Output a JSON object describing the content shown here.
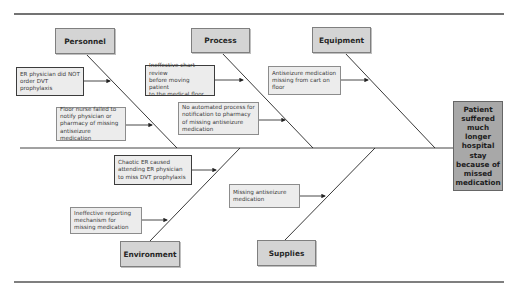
{
  "diagram": {
    "type": "fishbone",
    "effect": "Patient\nsuffered\nmuch\nlonger\nhospital\nstay\nbecause of\nmissed\nmedication",
    "categories": {
      "personnel": "Personnel",
      "process": "Process",
      "equipment": "Equipment",
      "environment": "Environment",
      "supplies": "Supplies"
    },
    "causes": {
      "personnel": [
        "ER physician did NOT\norder DVT prophylaxis",
        "Floor nurse failed to\nnotify physician or\npharmacy of missing\nantiseizure medication"
      ],
      "process": [
        "Ineffective chart review\nbefore moving patient\nto the medical floor",
        "No automated process for\nnotification to pharmacy\nof missing antiseizure\nmedication"
      ],
      "equipment": [
        "Antiseizure medication\nmissing from cart on\nfloor"
      ],
      "environment": [
        "Chaotic ER caused\nattending ER physician\nto miss DVT prophylaxis",
        "Ineffective reporting\nmechanism for\nmissing medication"
      ],
      "supplies": [
        "Missing antiseizure\nmedication"
      ]
    },
    "colors": {
      "category_fill": "#d4d4d4",
      "cause_fill": "#ececec",
      "effect_fill": "#a8a8a8",
      "line": "#333333"
    }
  }
}
